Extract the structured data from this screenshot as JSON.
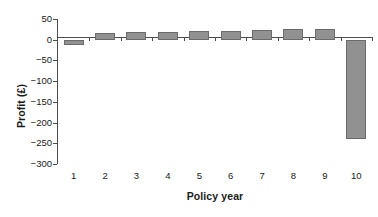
{
  "chart_data": {
    "type": "bar",
    "title": "",
    "xlabel": "Policy year",
    "ylabel": "Profit (£)",
    "categories": [
      "1",
      "2",
      "3",
      "4",
      "5",
      "6",
      "7",
      "8",
      "9",
      "10"
    ],
    "values": [
      -12,
      17,
      18,
      19,
      21,
      22,
      24,
      26,
      26,
      -240
    ],
    "ylim": [
      -300,
      50
    ],
    "ytick_labels": [
      "50",
      "0",
      "−50",
      "−100",
      "−150",
      "−200",
      "−250",
      "−300"
    ],
    "ytick_values": [
      50,
      0,
      -50,
      -100,
      -150,
      -200,
      -250,
      -300
    ],
    "grid": false,
    "legend": "none",
    "series_name": "Profit",
    "bar_color": "#919191",
    "bar_edge_color": "#6b6b6b",
    "axis_color": "#4d4d4d",
    "background": "#ffffff",
    "zero_line": 0
  }
}
